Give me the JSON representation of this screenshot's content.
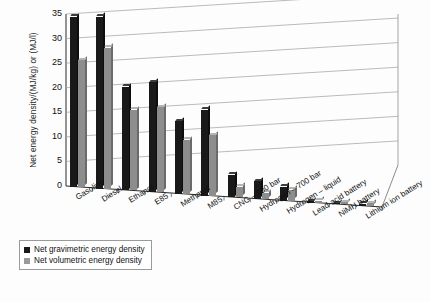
{
  "chart_data": {
    "type": "bar",
    "title": "",
    "subtitle": "",
    "xlabel": "",
    "ylabel": "Net energy density/(MJ/kg) or (MJ/l)",
    "ylim": [
      0,
      35
    ],
    "yticks": [
      0,
      5,
      10,
      15,
      20,
      25,
      30,
      35
    ],
    "ytick_labels": [
      "0",
      "5",
      "10",
      "15",
      "20",
      "25",
      "30",
      "35"
    ],
    "grid": true,
    "grid_axis": "y",
    "legend_position": "bottom-left",
    "style": "3d-clustered-column",
    "categories": [
      "Gasoline",
      "Diesel",
      "Ethanol",
      "E85",
      "Methanol",
      "M85",
      "CNG – 200 bar",
      "Hydrogen – 700 bar",
      "Hydrogen – liquid",
      "Lead-acid battery",
      "NiMH battery",
      "Lithium ion battery"
    ],
    "series": [
      {
        "name": "Net gravimetric energy density",
        "color": "#191919",
        "values": [
          34.6,
          35.0,
          21.1,
          22.4,
          14.8,
          17.5,
          4.6,
          3.6,
          2.9,
          0.2,
          0.3,
          0.5
        ]
      },
      {
        "name": "Net volumetric energy density",
        "color": "#8d8d8d",
        "values": [
          25.8,
          28.7,
          16.4,
          17.3,
          11.0,
          12.3,
          2.2,
          1.3,
          2.3,
          0.4,
          0.5,
          0.6
        ]
      }
    ]
  },
  "legend": {
    "entries": [
      {
        "label": "Net gravimetric energy density",
        "color": "#191919"
      },
      {
        "label": "Net volumetric energy density",
        "color": "#9a9a9a"
      }
    ]
  },
  "axes": {
    "y_title": "Net energy density/(MJ/kg) or (MJ/l)"
  }
}
